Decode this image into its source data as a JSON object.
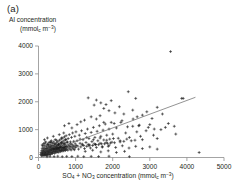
{
  "panel": {
    "label": "(a)"
  },
  "chart_data": {
    "type": "scatter",
    "title": "(a)",
    "xlabel": "SO4 + NO3 concentration (mmol_c m-3)",
    "ylabel": "Al concentration (mmol_c m-3)",
    "ylabel_line1": "Al concentration",
    "ylabel_line2": "(mmol_c m-3)",
    "xlim": [
      0,
      5000
    ],
    "ylim": [
      0,
      4000
    ],
    "xticks": [
      0,
      1000,
      2000,
      3000,
      4000,
      5000
    ],
    "yticks": [
      0,
      1000,
      2000,
      3000,
      4000
    ],
    "grid": false,
    "legend": null,
    "marker": "plus",
    "marker_color": "#1a1a1a",
    "trendline": {
      "type": "linear",
      "color": "#6f6f6f",
      "x_start": 620,
      "y_start": 380,
      "x_end": 4230,
      "y_end": 2160
    },
    "points": [
      [
        60,
        110
      ],
      [
        70,
        180
      ],
      [
        80,
        60
      ],
      [
        90,
        250
      ],
      [
        95,
        140
      ],
      [
        100,
        330
      ],
      [
        105,
        90
      ],
      [
        110,
        200
      ],
      [
        115,
        420
      ],
      [
        120,
        150
      ],
      [
        125,
        60
      ],
      [
        130,
        300
      ],
      [
        135,
        230
      ],
      [
        140,
        500
      ],
      [
        145,
        110
      ],
      [
        150,
        370
      ],
      [
        155,
        180
      ],
      [
        160,
        80
      ],
      [
        165,
        260
      ],
      [
        170,
        440
      ],
      [
        175,
        140
      ],
      [
        180,
        320
      ],
      [
        185,
        210
      ],
      [
        190,
        90
      ],
      [
        195,
        560
      ],
      [
        200,
        170
      ],
      [
        205,
        300
      ],
      [
        210,
        120
      ],
      [
        215,
        400
      ],
      [
        220,
        240
      ],
      [
        225,
        80
      ],
      [
        230,
        330
      ],
      [
        235,
        190
      ],
      [
        240,
        470
      ],
      [
        245,
        130
      ],
      [
        250,
        260
      ],
      [
        255,
        350
      ],
      [
        260,
        100
      ],
      [
        265,
        210
      ],
      [
        270,
        420
      ],
      [
        275,
        160
      ],
      [
        280,
        300
      ],
      [
        285,
        540
      ],
      [
        290,
        230
      ],
      [
        295,
        120
      ],
      [
        300,
        380
      ],
      [
        305,
        280
      ],
      [
        310,
        180
      ],
      [
        315,
        460
      ],
      [
        320,
        340
      ],
      [
        325,
        110
      ],
      [
        330,
        250
      ],
      [
        335,
        390
      ],
      [
        340,
        200
      ],
      [
        345,
        600
      ],
      [
        350,
        300
      ],
      [
        355,
        160
      ],
      [
        360,
        430
      ],
      [
        365,
        270
      ],
      [
        370,
        350
      ],
      [
        375,
        140
      ],
      [
        380,
        510
      ],
      [
        385,
        230
      ],
      [
        390,
        320
      ],
      [
        395,
        190
      ],
      [
        400,
        410
      ],
      [
        405,
        280
      ],
      [
        410,
        560
      ],
      [
        415,
        330
      ],
      [
        420,
        210
      ],
      [
        425,
        450
      ],
      [
        430,
        300
      ],
      [
        435,
        150
      ],
      [
        440,
        380
      ],
      [
        445,
        260
      ],
      [
        450,
        640
      ],
      [
        455,
        340
      ],
      [
        460,
        220
      ],
      [
        465,
        470
      ],
      [
        470,
        310
      ],
      [
        475,
        180
      ],
      [
        480,
        400
      ],
      [
        485,
        290
      ],
      [
        490,
        530
      ],
      [
        495,
        360
      ],
      [
        500,
        240
      ],
      [
        505,
        430
      ],
      [
        510,
        320
      ],
      [
        515,
        200
      ],
      [
        520,
        580
      ],
      [
        525,
        350
      ],
      [
        530,
        270
      ],
      [
        535,
        460
      ],
      [
        540,
        330
      ],
      [
        545,
        190
      ],
      [
        550,
        500
      ],
      [
        555,
        380
      ],
      [
        560,
        280
      ],
      [
        565,
        620
      ],
      [
        570,
        340
      ],
      [
        575,
        250
      ],
      [
        580,
        440
      ],
      [
        585,
        360
      ],
      [
        590,
        210
      ],
      [
        595,
        520
      ],
      [
        600,
        390
      ],
      [
        605,
        300
      ],
      [
        610,
        660
      ],
      [
        615,
        370
      ],
      [
        620,
        260
      ],
      [
        625,
        480
      ],
      [
        630,
        350
      ],
      [
        635,
        230
      ],
      [
        640,
        560
      ],
      [
        645,
        400
      ],
      [
        650,
        310
      ],
      [
        655,
        700
      ],
      [
        660,
        380
      ],
      [
        665,
        270
      ],
      [
        670,
        500
      ],
      [
        675,
        360
      ],
      [
        680,
        240
      ],
      [
        685,
        600
      ],
      [
        690,
        420
      ],
      [
        695,
        320
      ],
      [
        700,
        740
      ],
      [
        705,
        390
      ],
      [
        710,
        280
      ],
      [
        715,
        520
      ],
      [
        720,
        370
      ],
      [
        725,
        250
      ],
      [
        730,
        640
      ],
      [
        735,
        440
      ],
      [
        740,
        330
      ],
      [
        745,
        780
      ],
      [
        750,
        400
      ],
      [
        760,
        290
      ],
      [
        770,
        540
      ],
      [
        780,
        380
      ],
      [
        790,
        260
      ],
      [
        800,
        680
      ],
      [
        810,
        450
      ],
      [
        820,
        340
      ],
      [
        830,
        820
      ],
      [
        840,
        410
      ],
      [
        850,
        300
      ],
      [
        860,
        560
      ],
      [
        870,
        390
      ],
      [
        880,
        270
      ],
      [
        890,
        720
      ],
      [
        900,
        470
      ],
      [
        910,
        350
      ],
      [
        920,
        880
      ],
      [
        930,
        420
      ],
      [
        940,
        310
      ],
      [
        950,
        580
      ],
      [
        960,
        400
      ],
      [
        970,
        280
      ],
      [
        980,
        760
      ],
      [
        990,
        490
      ],
      [
        1000,
        360
      ],
      [
        1010,
        920
      ],
      [
        1020,
        430
      ],
      [
        1040,
        600
      ],
      [
        1060,
        410
      ],
      [
        1080,
        300
      ],
      [
        1100,
        800
      ],
      [
        1120,
        510
      ],
      [
        1140,
        380
      ],
      [
        1160,
        960
      ],
      [
        1180,
        450
      ],
      [
        1200,
        640
      ],
      [
        1220,
        430
      ],
      [
        1240,
        320
      ],
      [
        1260,
        860
      ],
      [
        1280,
        540
      ],
      [
        1300,
        400
      ],
      [
        1320,
        1020
      ],
      [
        1340,
        470
      ],
      [
        1360,
        680
      ],
      [
        1380,
        450
      ],
      [
        1400,
        340
      ],
      [
        1420,
        900
      ],
      [
        1440,
        570
      ],
      [
        1460,
        430
      ],
      [
        1480,
        1080
      ],
      [
        1500,
        490
      ],
      [
        1520,
        720
      ],
      [
        1540,
        470
      ],
      [
        1560,
        360
      ],
      [
        1580,
        940
      ],
      [
        1600,
        600
      ],
      [
        1620,
        460
      ],
      [
        1640,
        1140
      ],
      [
        1660,
        510
      ],
      [
        1680,
        760
      ],
      [
        1700,
        490
      ],
      [
        1720,
        380
      ],
      [
        1740,
        980
      ],
      [
        1760,
        630
      ],
      [
        1780,
        490
      ],
      [
        1800,
        1200
      ],
      [
        1820,
        530
      ],
      [
        1840,
        800
      ],
      [
        1860,
        510
      ],
      [
        1880,
        400
      ],
      [
        1900,
        1020
      ],
      [
        1920,
        660
      ],
      [
        1940,
        520
      ],
      [
        1960,
        1260
      ],
      [
        1980,
        550
      ],
      [
        2000,
        840
      ],
      [
        2050,
        530
      ],
      [
        2100,
        1060
      ],
      [
        2150,
        690
      ],
      [
        2200,
        560
      ],
      [
        2250,
        1320
      ],
      [
        2300,
        580
      ],
      [
        2350,
        880
      ],
      [
        2400,
        1100
      ],
      [
        2450,
        720
      ],
      [
        2500,
        600
      ],
      [
        2550,
        1380
      ],
      [
        2600,
        620
      ],
      [
        2650,
        920
      ],
      [
        2700,
        1140
      ],
      [
        2750,
        760
      ],
      [
        2800,
        640
      ],
      [
        2900,
        960
      ],
      [
        3000,
        1180
      ],
      [
        3100,
        800
      ],
      [
        3200,
        680
      ],
      [
        3300,
        1000
      ],
      [
        3500,
        1220
      ],
      [
        3700,
        840
      ],
      [
        3900,
        2120
      ],
      [
        230,
        30
      ],
      [
        310,
        40
      ],
      [
        420,
        35
      ],
      [
        520,
        45
      ],
      [
        640,
        30
      ],
      [
        760,
        40
      ],
      [
        900,
        35
      ],
      [
        1060,
        45
      ],
      [
        1220,
        30
      ],
      [
        1420,
        40
      ],
      [
        1620,
        35
      ],
      [
        1900,
        45
      ],
      [
        2450,
        30
      ],
      [
        4330,
        180
      ],
      [
        1340,
        2140
      ],
      [
        1500,
        1880
      ],
      [
        1560,
        2060
      ],
      [
        1680,
        1960
      ],
      [
        1760,
        1760
      ],
      [
        1820,
        1900
      ],
      [
        1900,
        1680
      ],
      [
        1960,
        2040
      ],
      [
        2060,
        1600
      ],
      [
        2180,
        1820
      ],
      [
        2300,
        1560
      ],
      [
        2420,
        2360
      ],
      [
        2540,
        1700
      ],
      [
        2620,
        2120
      ],
      [
        2660,
        1460
      ],
      [
        2800,
        1520
      ],
      [
        2920,
        1640
      ],
      [
        3060,
        1400
      ],
      [
        3200,
        1800
      ],
      [
        3340,
        1560
      ],
      [
        3420,
        1080
      ],
      [
        3560,
        3800
      ],
      [
        3660,
        1120
      ],
      [
        3860,
        2120
      ],
      [
        1040,
        1180
      ],
      [
        1140,
        1280
      ],
      [
        900,
        1060
      ],
      [
        820,
        1220
      ],
      [
        700,
        1140
      ],
      [
        1240,
        1340
      ],
      [
        1420,
        1460
      ],
      [
        1560,
        1380
      ],
      [
        1660,
        1500
      ],
      [
        1760,
        1260
      ],
      [
        2040,
        1220
      ],
      [
        2220,
        1260
      ],
      [
        2540,
        1120
      ],
      [
        2720,
        1160
      ],
      [
        2960,
        1080
      ],
      [
        3120,
        1020
      ],
      [
        1120,
        660
      ],
      [
        1300,
        720
      ],
      [
        1480,
        640
      ],
      [
        1660,
        700
      ],
      [
        1840,
        620
      ],
      [
        2020,
        680
      ],
      [
        2200,
        600
      ],
      [
        2380,
        660
      ],
      [
        1180,
        480
      ],
      [
        1360,
        420
      ],
      [
        1540,
        460
      ],
      [
        1720,
        380
      ],
      [
        1900,
        440
      ],
      [
        2080,
        360
      ],
      [
        2260,
        420
      ],
      [
        2440,
        340
      ],
      [
        2620,
        400
      ],
      [
        2800,
        320
      ],
      [
        3000,
        380
      ],
      [
        3200,
        300
      ],
      [
        1260,
        220
      ],
      [
        1460,
        260
      ],
      [
        1680,
        200
      ],
      [
        1880,
        240
      ],
      [
        2100,
        180
      ],
      [
        2320,
        220
      ],
      [
        160,
        640
      ],
      [
        240,
        700
      ],
      [
        320,
        560
      ],
      [
        400,
        760
      ],
      [
        480,
        620
      ],
      [
        560,
        820
      ],
      [
        620,
        700
      ],
      [
        680,
        880
      ],
      [
        740,
        640
      ],
      [
        100,
        450
      ],
      [
        180,
        520
      ],
      [
        260,
        480
      ],
      [
        340,
        540
      ],
      [
        440,
        500
      ],
      [
        540,
        460
      ],
      [
        620,
        540
      ],
      [
        700,
        480
      ],
      [
        780,
        560
      ],
      [
        860,
        500
      ]
    ]
  }
}
